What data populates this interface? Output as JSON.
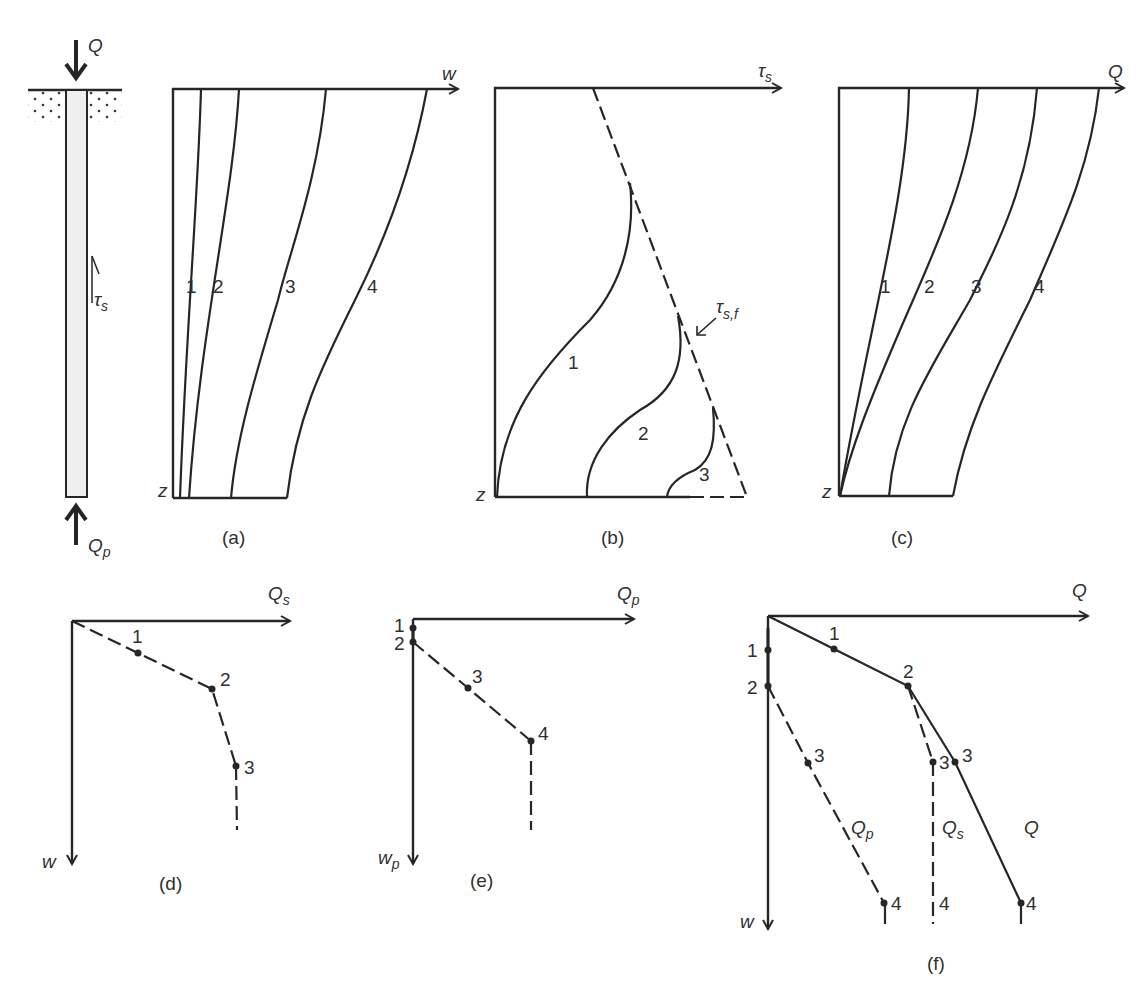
{
  "pile": {
    "top_load": "Q",
    "tip_load": "Q",
    "tip_load_sub": "p",
    "shaft_stress": "τ",
    "shaft_stress_sub": "s"
  },
  "panel_a": {
    "caption": "(a)",
    "x_axis": "w",
    "z_axis": "z",
    "curves": [
      "1",
      "2",
      "3",
      "4"
    ]
  },
  "panel_b": {
    "caption": "(b)",
    "x_axis": "τ",
    "x_axis_sub": "s",
    "z_axis": "z",
    "limit_label": "τ",
    "limit_label_sub": "s,f",
    "curves": [
      "1",
      "2",
      "3"
    ]
  },
  "panel_c": {
    "caption": "(c)",
    "x_axis": "Q",
    "z_axis": "z",
    "curves": [
      "1",
      "2",
      "3",
      "4"
    ]
  },
  "panel_d": {
    "caption": "(d)",
    "x_axis": "Q",
    "x_axis_sub": "s",
    "y_axis": "w",
    "points": [
      "1",
      "2",
      "3"
    ]
  },
  "panel_e": {
    "caption": "(e)",
    "x_axis": "Q",
    "x_axis_sub": "p",
    "y_axis": "w",
    "y_axis_sub": "p",
    "points": [
      "1",
      "2",
      "3",
      "4"
    ]
  },
  "panel_f": {
    "caption": "(f)",
    "x_axis": "Q",
    "y_axis": "w",
    "axis_points": [
      "1",
      "2"
    ],
    "q_points": [
      "1",
      "2",
      "3",
      "4"
    ],
    "qs_points": [
      "3",
      "4"
    ],
    "qp_points": [
      "3",
      "4"
    ],
    "line_labels": {
      "qp": "Q",
      "qp_sub": "p",
      "qs": "Q",
      "qs_sub": "s",
      "q": "Q"
    }
  }
}
